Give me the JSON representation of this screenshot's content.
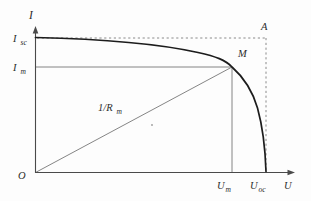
{
  "figure": {
    "background": "#fdfdfd",
    "axis_color": "#4a4a4a",
    "thin_line_color": "#777777",
    "dash_color": "#8a8a8a",
    "curve_color": "#1c1c1c",
    "text_color": "#2b2b2b",
    "labels": {
      "y_axis": "I",
      "short_circuit_current": {
        "base": "I",
        "sub": "sc"
      },
      "max_power_current": {
        "base": "I",
        "sub": "m"
      },
      "point_a": "A",
      "point_m": "M",
      "load_line_slope": {
        "base": "1/R",
        "sub": "m"
      },
      "origin": "O",
      "max_power_voltage": {
        "base": "U",
        "sub": "m"
      },
      "open_circuit_voltage": {
        "base": "U",
        "sub": "oc"
      },
      "x_axis": "U"
    }
  }
}
